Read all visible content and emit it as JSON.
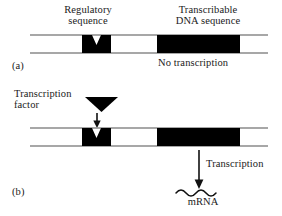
{
  "figure": {
    "title_labels": {
      "regulatory_sequence": "Regulatory\nsequence",
      "regulatory_sequence_line1": "Regulatory",
      "regulatory_sequence_line2": "sequence",
      "transcribable_line1": "Transcribable",
      "transcribable_line2": "DNA sequence"
    },
    "panel_a": {
      "label": "(a)",
      "status_text": "No transcription"
    },
    "panel_b": {
      "label": "(b)",
      "transcription_factor_line1": "Transcription",
      "transcription_factor_line2": "factor",
      "transcription_arrow_label": "Transcription",
      "product_label": "mRNA"
    },
    "colors": {
      "ink": "#111111",
      "box_fill": "#000000",
      "strand_line": "#808080",
      "background": "#ffffff"
    },
    "geometry": {
      "strand_left_x": 30,
      "strand_right_x": 268,
      "panel_a_strand_top_y": 35,
      "panel_a_strand_bottom_y": 53,
      "panel_b_strand_top_y": 128,
      "panel_b_strand_bottom_y": 146,
      "regulatory_box_x": 82,
      "regulatory_box_width": 29,
      "transcribable_box_x": 157,
      "transcribable_box_width": 83,
      "mrna_wave_count": 4
    }
  }
}
